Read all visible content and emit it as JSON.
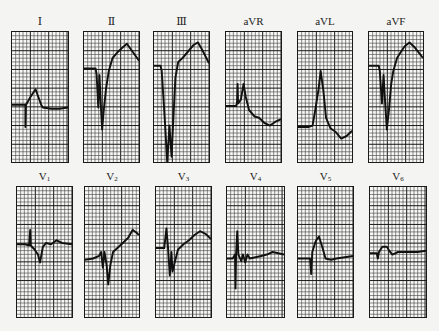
{
  "figure": {
    "colors": {
      "trace": "#111111",
      "grid_minor": "#3a3a3a",
      "grid_major": "#111111",
      "paper": "#f7f7f5"
    },
    "grid": {
      "minor_px": 3.8,
      "major_every": 5
    }
  },
  "leads": [
    {
      "id": "I",
      "label": "Ⅰ",
      "sub": "",
      "box": [
        11,
        31,
        58,
        132
      ],
      "trace": [
        [
          0,
          0.56
        ],
        [
          0.22,
          0.56
        ],
        [
          0.24,
          0.56
        ],
        [
          0.24,
          0.73
        ],
        [
          0.25,
          0.56
        ],
        [
          0.33,
          0.5
        ],
        [
          0.42,
          0.44
        ],
        [
          0.52,
          0.56
        ],
        [
          0.55,
          0.58
        ],
        [
          0.7,
          0.59
        ],
        [
          0.85,
          0.59
        ],
        [
          1,
          0.58
        ]
      ]
    },
    {
      "id": "II",
      "label": "Ⅱ",
      "sub": "",
      "box": [
        83,
        31,
        57,
        132
      ],
      "trace": [
        [
          0,
          0.28
        ],
        [
          0.18,
          0.28
        ],
        [
          0.21,
          0.28
        ],
        [
          0.23,
          0.33
        ],
        [
          0.26,
          0.58
        ],
        [
          0.28,
          0.33
        ],
        [
          0.31,
          0.6
        ],
        [
          0.33,
          0.75
        ],
        [
          0.36,
          0.6
        ],
        [
          0.4,
          0.44
        ],
        [
          0.45,
          0.3
        ],
        [
          0.52,
          0.2
        ],
        [
          0.6,
          0.16
        ],
        [
          0.7,
          0.12
        ],
        [
          0.78,
          0.09
        ],
        [
          0.88,
          0.15
        ],
        [
          1,
          0.22
        ]
      ]
    },
    {
      "id": "III",
      "label": "Ⅲ",
      "sub": "",
      "box": [
        153,
        31,
        57,
        132
      ],
      "trace": [
        [
          0,
          0.26
        ],
        [
          0.12,
          0.26
        ],
        [
          0.14,
          0.3
        ],
        [
          0.2,
          0.7
        ],
        [
          0.24,
          1.0
        ],
        [
          0.28,
          0.72
        ],
        [
          0.32,
          0.96
        ],
        [
          0.36,
          0.6
        ],
        [
          0.39,
          0.35
        ],
        [
          0.44,
          0.23
        ],
        [
          0.52,
          0.2
        ],
        [
          0.62,
          0.15
        ],
        [
          0.72,
          0.1
        ],
        [
          0.8,
          0.08
        ],
        [
          0.88,
          0.14
        ],
        [
          1,
          0.24
        ]
      ]
    },
    {
      "id": "aVR",
      "label": "aVR",
      "sub": "",
      "box": [
        225,
        31,
        57,
        132
      ],
      "trace": [
        [
          0,
          0.57
        ],
        [
          0.18,
          0.57
        ],
        [
          0.2,
          0.55
        ],
        [
          0.21,
          0.4
        ],
        [
          0.22,
          0.55
        ],
        [
          0.27,
          0.52
        ],
        [
          0.32,
          0.4
        ],
        [
          0.36,
          0.5
        ],
        [
          0.42,
          0.6
        ],
        [
          0.52,
          0.65
        ],
        [
          0.6,
          0.66
        ],
        [
          0.7,
          0.7
        ],
        [
          0.8,
          0.72
        ],
        [
          0.9,
          0.69
        ],
        [
          1,
          0.67
        ]
      ]
    },
    {
      "id": "aVL",
      "label": "aVL",
      "sub": "",
      "box": [
        297,
        31,
        56,
        132
      ],
      "trace": [
        [
          0,
          0.73
        ],
        [
          0.2,
          0.73
        ],
        [
          0.27,
          0.72
        ],
        [
          0.32,
          0.6
        ],
        [
          0.38,
          0.44
        ],
        [
          0.42,
          0.3
        ],
        [
          0.47,
          0.45
        ],
        [
          0.52,
          0.66
        ],
        [
          0.6,
          0.74
        ],
        [
          0.7,
          0.77
        ],
        [
          0.8,
          0.82
        ],
        [
          0.9,
          0.8
        ],
        [
          1,
          0.76
        ]
      ]
    },
    {
      "id": "aVF",
      "label": "aVF",
      "sub": "",
      "box": [
        368,
        31,
        56,
        132
      ],
      "trace": [
        [
          0,
          0.26
        ],
        [
          0.18,
          0.26
        ],
        [
          0.2,
          0.3
        ],
        [
          0.24,
          0.55
        ],
        [
          0.27,
          0.33
        ],
        [
          0.3,
          0.55
        ],
        [
          0.33,
          0.75
        ],
        [
          0.37,
          0.6
        ],
        [
          0.41,
          0.4
        ],
        [
          0.45,
          0.3
        ],
        [
          0.52,
          0.2
        ],
        [
          0.58,
          0.16
        ],
        [
          0.66,
          0.11
        ],
        [
          0.75,
          0.08
        ],
        [
          0.85,
          0.12
        ],
        [
          1,
          0.2
        ]
      ]
    },
    {
      "id": "V1",
      "label": "V",
      "sub": "1",
      "box": [
        16,
        186,
        57,
        132
      ],
      "trace": [
        [
          0,
          0.44
        ],
        [
          0.15,
          0.44
        ],
        [
          0.22,
          0.45
        ],
        [
          0.24,
          0.33
        ],
        [
          0.25,
          0.45
        ],
        [
          0.32,
          0.48
        ],
        [
          0.38,
          0.52
        ],
        [
          0.42,
          0.58
        ],
        [
          0.47,
          0.46
        ],
        [
          0.53,
          0.43
        ],
        [
          0.62,
          0.44
        ],
        [
          0.72,
          0.41
        ],
        [
          0.82,
          0.43
        ],
        [
          1,
          0.44
        ]
      ]
    },
    {
      "id": "V2",
      "label": "V",
      "sub": "2",
      "box": [
        84,
        186,
        56,
        132
      ],
      "trace": [
        [
          0,
          0.56
        ],
        [
          0.15,
          0.55
        ],
        [
          0.26,
          0.53
        ],
        [
          0.3,
          0.5
        ],
        [
          0.33,
          0.62
        ],
        [
          0.36,
          0.5
        ],
        [
          0.4,
          0.6
        ],
        [
          0.43,
          0.75
        ],
        [
          0.47,
          0.6
        ],
        [
          0.52,
          0.5
        ],
        [
          0.6,
          0.47
        ],
        [
          0.7,
          0.43
        ],
        [
          0.8,
          0.39
        ],
        [
          0.88,
          0.33
        ],
        [
          0.95,
          0.35
        ],
        [
          1,
          0.37
        ]
      ]
    },
    {
      "id": "V3",
      "label": "V",
      "sub": "3",
      "box": [
        155,
        186,
        57,
        132
      ],
      "trace": [
        [
          0,
          0.47
        ],
        [
          0.1,
          0.47
        ],
        [
          0.15,
          0.47
        ],
        [
          0.19,
          0.32
        ],
        [
          0.22,
          0.47
        ],
        [
          0.25,
          0.68
        ],
        [
          0.28,
          0.5
        ],
        [
          0.3,
          0.65
        ],
        [
          0.34,
          0.58
        ],
        [
          0.4,
          0.48
        ],
        [
          0.5,
          0.44
        ],
        [
          0.6,
          0.41
        ],
        [
          0.7,
          0.37
        ],
        [
          0.8,
          0.34
        ],
        [
          0.9,
          0.36
        ],
        [
          1,
          0.4
        ]
      ]
    },
    {
      "id": "V4",
      "label": "V",
      "sub": "4",
      "box": [
        226,
        186,
        59,
        132
      ],
      "trace": [
        [
          0,
          0.55
        ],
        [
          0.1,
          0.55
        ],
        [
          0.14,
          0.52
        ],
        [
          0.15,
          0.78
        ],
        [
          0.16,
          0.52
        ],
        [
          0.18,
          0.34
        ],
        [
          0.2,
          0.52
        ],
        [
          0.25,
          0.57
        ],
        [
          0.28,
          0.52
        ],
        [
          0.32,
          0.58
        ],
        [
          0.36,
          0.52
        ],
        [
          0.4,
          0.55
        ],
        [
          0.5,
          0.54
        ],
        [
          0.6,
          0.53
        ],
        [
          0.7,
          0.52
        ],
        [
          0.8,
          0.5
        ],
        [
          0.9,
          0.51
        ],
        [
          1,
          0.52
        ]
      ]
    },
    {
      "id": "V5",
      "label": "V",
      "sub": "5",
      "box": [
        297,
        186,
        57,
        132
      ],
      "trace": [
        [
          0,
          0.55
        ],
        [
          0.2,
          0.55
        ],
        [
          0.22,
          0.55
        ],
        [
          0.24,
          0.67
        ],
        [
          0.26,
          0.5
        ],
        [
          0.32,
          0.42
        ],
        [
          0.38,
          0.38
        ],
        [
          0.44,
          0.46
        ],
        [
          0.5,
          0.55
        ],
        [
          0.6,
          0.56
        ],
        [
          0.7,
          0.55
        ],
        [
          0.85,
          0.54
        ],
        [
          1,
          0.53
        ]
      ]
    },
    {
      "id": "V6",
      "label": "V",
      "sub": "6",
      "box": [
        369,
        186,
        58,
        132
      ],
      "trace": [
        [
          0,
          0.51
        ],
        [
          0.12,
          0.51
        ],
        [
          0.14,
          0.55
        ],
        [
          0.16,
          0.5
        ],
        [
          0.22,
          0.46
        ],
        [
          0.3,
          0.46
        ],
        [
          0.36,
          0.5
        ],
        [
          0.4,
          0.52
        ],
        [
          0.5,
          0.5
        ],
        [
          0.7,
          0.5
        ],
        [
          0.85,
          0.5
        ],
        [
          1,
          0.49
        ]
      ]
    }
  ]
}
